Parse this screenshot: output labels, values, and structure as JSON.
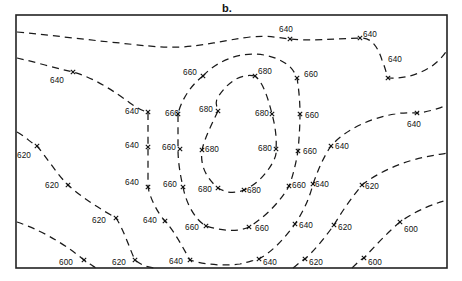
{
  "figure": {
    "title": "b.",
    "type": "contour-map",
    "background_color": "#ffffff",
    "line_color": "#1a1a1a",
    "frame_color": "#222222",
    "frame": {
      "x": 16,
      "y": 15,
      "width": 431,
      "height": 253
    }
  },
  "chart_data": {
    "type": "contour",
    "title": "b.",
    "xlabel": "",
    "ylabel": "",
    "grid": false,
    "legend": "none",
    "contour_interval": 20,
    "contour_levels": [
      600,
      620,
      640,
      660,
      680
    ],
    "level_description": "Closed high centered near the middle-right of the map at 680; values decrease outward toward 600 at the lower-left and lower-right corners.",
    "xlim": [
      16,
      447
    ],
    "ylim": [
      15,
      268
    ],
    "labels": [
      {
        "value": "640",
        "x": 286,
        "y": 30
      },
      {
        "value": "640",
        "x": 370,
        "y": 35
      },
      {
        "value": "640",
        "x": 395,
        "y": 60
      },
      {
        "value": "640",
        "x": 57,
        "y": 81
      },
      {
        "value": "640",
        "x": 132,
        "y": 112
      },
      {
        "value": "640",
        "x": 132,
        "y": 146
      },
      {
        "value": "640",
        "x": 132,
        "y": 183
      },
      {
        "value": "640",
        "x": 150,
        "y": 221
      },
      {
        "value": "640",
        "x": 176,
        "y": 262
      },
      {
        "value": "640",
        "x": 270,
        "y": 263
      },
      {
        "value": "640",
        "x": 306,
        "y": 226
      },
      {
        "value": "640",
        "x": 322,
        "y": 185
      },
      {
        "value": "640",
        "x": 342,
        "y": 147
      },
      {
        "value": "640",
        "x": 414,
        "y": 125
      },
      {
        "value": "660",
        "x": 190,
        "y": 73
      },
      {
        "value": "660",
        "x": 311,
        "y": 75
      },
      {
        "value": "660",
        "x": 172,
        "y": 114
      },
      {
        "value": "660",
        "x": 312,
        "y": 116
      },
      {
        "value": "660",
        "x": 169,
        "y": 148
      },
      {
        "value": "660",
        "x": 310,
        "y": 152
      },
      {
        "value": "660",
        "x": 170,
        "y": 185
      },
      {
        "value": "660",
        "x": 299,
        "y": 186
      },
      {
        "value": "660",
        "x": 192,
        "y": 228
      },
      {
        "value": "660",
        "x": 262,
        "y": 229
      },
      {
        "value": "680",
        "x": 265,
        "y": 72
      },
      {
        "value": "680",
        "x": 206,
        "y": 110
      },
      {
        "value": "680",
        "x": 262,
        "y": 114
      },
      {
        "value": "680",
        "x": 212,
        "y": 150
      },
      {
        "value": "680",
        "x": 265,
        "y": 149
      },
      {
        "value": "680",
        "x": 205,
        "y": 190
      },
      {
        "value": "680",
        "x": 254,
        "y": 191
      },
      {
        "value": "620",
        "x": 24,
        "y": 156
      },
      {
        "value": "620",
        "x": 52,
        "y": 186
      },
      {
        "value": "620",
        "x": 99,
        "y": 221
      },
      {
        "value": "620",
        "x": 119,
        "y": 263
      },
      {
        "value": "620",
        "x": 316,
        "y": 263
      },
      {
        "value": "620",
        "x": 345,
        "y": 228
      },
      {
        "value": "620",
        "x": 372,
        "y": 187
      },
      {
        "value": "600",
        "x": 66,
        "y": 263
      },
      {
        "value": "600",
        "x": 375,
        "y": 263
      },
      {
        "value": "600",
        "x": 411,
        "y": 230
      }
    ],
    "markers": [
      {
        "x": 290,
        "y": 39
      },
      {
        "x": 360,
        "y": 38
      },
      {
        "x": 388,
        "y": 78
      },
      {
        "x": 73,
        "y": 72
      },
      {
        "x": 148,
        "y": 112
      },
      {
        "x": 148,
        "y": 147
      },
      {
        "x": 148,
        "y": 187
      },
      {
        "x": 165,
        "y": 221
      },
      {
        "x": 190,
        "y": 260
      },
      {
        "x": 259,
        "y": 259
      },
      {
        "x": 295,
        "y": 224
      },
      {
        "x": 313,
        "y": 184
      },
      {
        "x": 331,
        "y": 146
      },
      {
        "x": 417,
        "y": 113
      },
      {
        "x": 203,
        "y": 76
      },
      {
        "x": 297,
        "y": 78
      },
      {
        "x": 178,
        "y": 114
      },
      {
        "x": 300,
        "y": 114
      },
      {
        "x": 180,
        "y": 149
      },
      {
        "x": 298,
        "y": 151
      },
      {
        "x": 183,
        "y": 187
      },
      {
        "x": 289,
        "y": 186
      },
      {
        "x": 206,
        "y": 226
      },
      {
        "x": 249,
        "y": 227
      },
      {
        "x": 255,
        "y": 76
      },
      {
        "x": 218,
        "y": 111
      },
      {
        "x": 272,
        "y": 114
      },
      {
        "x": 202,
        "y": 150
      },
      {
        "x": 276,
        "y": 149
      },
      {
        "x": 218,
        "y": 188
      },
      {
        "x": 244,
        "y": 190
      },
      {
        "x": 37,
        "y": 146
      },
      {
        "x": 68,
        "y": 185
      },
      {
        "x": 116,
        "y": 218
      },
      {
        "x": 135,
        "y": 260
      },
      {
        "x": 305,
        "y": 259
      },
      {
        "x": 334,
        "y": 225
      },
      {
        "x": 362,
        "y": 185
      },
      {
        "x": 84,
        "y": 260
      },
      {
        "x": 364,
        "y": 258
      },
      {
        "x": 400,
        "y": 222
      }
    ],
    "contours": [
      {
        "level": 640,
        "label": "640-north",
        "path": "M 17,32 C 50,35 80,39 110,42 C 140,45 160,48 180,47 C 205,46 225,40 250,37 C 268,35 280,38 290,39 C 310,41 335,39 360,38 C 372,37 378,48 382,60 C 386,70 387,76 388,78 C 405,79 420,74 432,66 C 440,60 445,54 447,50"
      },
      {
        "level": 640,
        "label": "640-west",
        "path": "M 17,58 C 35,62 55,68 73,72 C 95,78 115,92 130,103 C 140,110 146,112 148,112 C 148,125 148,136 148,147 C 148,160 148,175 148,187 C 150,198 157,212 165,221 C 175,232 183,248 190,260 C 205,265 225,266 240,264 C 249,262 254,260 259,259 C 272,252 285,238 295,224 C 305,209 310,196 313,184 C 318,170 324,156 331,146 C 345,130 370,118 395,114 C 405,112 413,113 417,113 C 427,112 438,109 447,105"
      },
      {
        "level": 660,
        "label": "660-ring",
        "path": "M 203,76 C 212,66 226,58 242,55 C 258,52 276,56 288,65 C 294,70 296,76 297,78 C 299,90 300,103 300,114 C 300,126 299,140 298,151 C 296,163 293,176 289,186 C 282,199 268,215 249,227 C 236,233 219,230 206,226 C 195,220 186,203 183,187 C 180,174 178,161 178,149 C 178,137 178,125 178,114 C 181,101 190,86 203,76"
      },
      {
        "level": 680,
        "label": "680-ring",
        "path": "M 255,76 C 240,73 227,83 218,97 C 214,103 218,109 218,111 C 212,124 205,137 202,150 C 200,164 205,177 218,188 C 228,194 236,193 244,190 C 258,184 268,172 274,160 C 277,153 276,151 276,149 C 277,138 275,125 272,114 C 268,98 263,82 255,76"
      },
      {
        "level": 620,
        "label": "620-southwest",
        "path": "M 17,132 C 26,137 31,143 37,146 C 45,155 56,173 68,185 C 82,198 102,210 116,218 C 124,230 130,250 135,260 C 142,266 150,268 158,268"
      },
      {
        "level": 620,
        "label": "620-southeast",
        "path": "M 293,268 C 298,264 302,260 305,259 C 315,250 326,236 334,225 C 342,211 353,196 362,185 C 380,171 405,161 425,157 C 435,155 442,154 447,153"
      },
      {
        "level": 600,
        "label": "600-southwest",
        "path": "M 17,222 C 35,228 60,240 84,260 C 90,264 94,267 96,268"
      },
      {
        "level": 600,
        "label": "600-southeast",
        "path": "M 352,268 C 357,263 361,259 364,258 C 374,247 388,232 400,222 C 418,209 437,203 447,200"
      }
    ]
  }
}
